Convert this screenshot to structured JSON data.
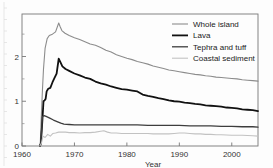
{
  "chart_data": {
    "type": "line",
    "title": "",
    "subtitle": "",
    "xlabel": "Year",
    "ylabel": "",
    "xlim": [
      1960,
      2005
    ],
    "ylim": [
      0,
      2.95
    ],
    "xticks": [
      1960,
      1970,
      1980,
      1990,
      2000
    ],
    "xtick_labels": [
      "1960",
      "1970",
      "1980",
      "1990",
      "2000"
    ],
    "yticks": [
      0,
      1,
      2
    ],
    "ytick_labels": [
      "0",
      "1",
      "2"
    ],
    "yminor_ticks": [
      0.5,
      1.5,
      2.5
    ],
    "grid": false,
    "legend_position": "top-right",
    "frame": "box",
    "series": [
      {
        "name": "Whole island",
        "color": "#8c8c8c",
        "width": 1.1,
        "x": [
          1963.4,
          1963.5,
          1963.7,
          1963.9,
          1964.1,
          1964.4,
          1964.8,
          1965.2,
          1965.8,
          1966.4,
          1967.0,
          1967.3,
          1967.6,
          1968.2,
          1969.0,
          1970.0,
          1971.0,
          1972.0,
          1973.0,
          1974.0,
          1975.0,
          1976.0,
          1977.0,
          1978.0,
          1979.0,
          1980.0,
          1981.0,
          1982.0,
          1983.0,
          1984.0,
          1985.0,
          1986.0,
          1987.0,
          1988.0,
          1989.0,
          1990.0,
          1991.0,
          1992.0,
          1993.0,
          1994.0,
          1995.0,
          1996.0,
          1997.0,
          1998.0,
          1999.0,
          2000.0,
          2001.0,
          2002.0,
          2003.0,
          2004.0,
          2005.0
        ],
        "values": [
          0.0,
          0.1,
          0.72,
          1.25,
          1.72,
          2.18,
          2.4,
          2.47,
          2.5,
          2.55,
          2.75,
          2.66,
          2.58,
          2.52,
          2.47,
          2.42,
          2.38,
          2.33,
          2.28,
          2.25,
          2.2,
          2.14,
          2.1,
          2.04,
          2.0,
          1.96,
          1.93,
          1.89,
          1.86,
          1.83,
          1.79,
          1.76,
          1.73,
          1.7,
          1.68,
          1.66,
          1.64,
          1.62,
          1.6,
          1.59,
          1.57,
          1.56,
          1.54,
          1.53,
          1.52,
          1.51,
          1.5,
          1.48,
          1.47,
          1.46,
          1.45
        ]
      },
      {
        "name": "Lava",
        "color": "#111111",
        "width": 1.8,
        "x": [
          1963.4,
          1963.6,
          1963.9,
          1964.1,
          1964.3,
          1964.5,
          1964.7,
          1965.0,
          1965.4,
          1965.8,
          1966.2,
          1966.6,
          1967.0,
          1967.3,
          1967.7,
          1968.3,
          1969.0,
          1970.0,
          1971.0,
          1972.0,
          1973.0,
          1974.0,
          1975.0,
          1976.0,
          1977.0,
          1978.0,
          1979.0,
          1980.0,
          1981.0,
          1982.0,
          1983.0,
          1984.0,
          1985.0,
          1986.0,
          1987.0,
          1988.0,
          1989.0,
          1990.0,
          1991.0,
          1992.0,
          1993.0,
          1994.0,
          1995.0,
          1996.0,
          1997.0,
          1998.0,
          1999.0,
          2000.0,
          2001.0,
          2002.0,
          2003.0,
          2004.0,
          2005.0
        ],
        "values": [
          0.0,
          0.05,
          0.6,
          1.0,
          1.02,
          1.05,
          1.22,
          1.28,
          1.3,
          1.42,
          1.52,
          1.62,
          1.95,
          1.88,
          1.78,
          1.72,
          1.68,
          1.62,
          1.58,
          1.53,
          1.5,
          1.44,
          1.4,
          1.37,
          1.33,
          1.3,
          1.27,
          1.26,
          1.24,
          1.22,
          1.15,
          1.12,
          1.1,
          1.07,
          1.05,
          1.02,
          1.0,
          0.99,
          0.97,
          0.96,
          0.94,
          0.93,
          0.91,
          0.9,
          0.89,
          0.88,
          0.86,
          0.85,
          0.84,
          0.82,
          0.81,
          0.8,
          0.78
        ]
      },
      {
        "name": "Tephra and tuff",
        "color": "#3d3d3d",
        "width": 1.3,
        "x": [
          1963.4,
          1963.6,
          1963.9,
          1964.2,
          1964.6,
          1965.2,
          1966.0,
          1966.8,
          1967.4,
          1968.0,
          1969.0,
          1970.0,
          1972.0,
          1974.0,
          1976.0,
          1978.0,
          1980.0,
          1982.0,
          1984.0,
          1986.0,
          1988.0,
          1990.0,
          1992.0,
          1994.0,
          1996.0,
          1998.0,
          2000.0,
          2002.0,
          2004.0,
          2005.0
        ],
        "values": [
          0.0,
          0.08,
          0.66,
          0.68,
          0.66,
          0.63,
          0.58,
          0.54,
          0.51,
          0.49,
          0.48,
          0.47,
          0.47,
          0.47,
          0.47,
          0.47,
          0.47,
          0.47,
          0.46,
          0.46,
          0.46,
          0.46,
          0.45,
          0.45,
          0.45,
          0.44,
          0.44,
          0.43,
          0.43,
          0.42
        ]
      },
      {
        "name": "Coastal sediment",
        "color": "#c2c2c2",
        "width": 1.1,
        "x": [
          1963.4,
          1963.7,
          1964.0,
          1964.4,
          1964.9,
          1965.4,
          1965.9,
          1966.4,
          1967.0,
          1967.6,
          1968.3,
          1969.0,
          1970.0,
          1971.0,
          1972.0,
          1973.0,
          1974.0,
          1975.0,
          1975.6,
          1976.3,
          1977.0,
          1978.0,
          1979.0,
          1980.0,
          1981.0,
          1982.0,
          1983.0,
          1984.0,
          1985.0,
          1986.0,
          1987.0,
          1988.0,
          1989.0,
          1990.0,
          1991.0,
          1992.0,
          1993.0,
          1994.0,
          1995.0,
          1996.0,
          1997.0,
          1998.0,
          2000.0,
          2002.0,
          2004.0,
          2005.0
        ],
        "values": [
          0.0,
          0.06,
          0.22,
          0.19,
          0.26,
          0.22,
          0.28,
          0.29,
          0.31,
          0.31,
          0.31,
          0.3,
          0.3,
          0.29,
          0.3,
          0.3,
          0.31,
          0.33,
          0.34,
          0.31,
          0.29,
          0.29,
          0.28,
          0.28,
          0.28,
          0.28,
          0.28,
          0.28,
          0.27,
          0.27,
          0.27,
          0.27,
          0.28,
          0.29,
          0.29,
          0.28,
          0.27,
          0.27,
          0.26,
          0.26,
          0.25,
          0.25,
          0.24,
          0.24,
          0.23,
          0.22
        ]
      }
    ],
    "legend_entries": [
      {
        "label": "Whole island",
        "color": "#8c8c8c",
        "width": 1.1
      },
      {
        "label": "Lava",
        "color": "#111111",
        "width": 1.8
      },
      {
        "label": "Tephra and tuff",
        "color": "#3d3d3d",
        "width": 1.3
      },
      {
        "label": "Coastal sediment",
        "color": "#c2c2c2",
        "width": 1.1
      }
    ]
  }
}
